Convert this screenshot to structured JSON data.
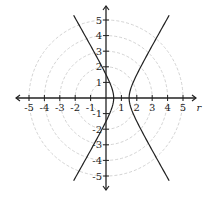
{
  "chart_data": {
    "type": "line",
    "subtype": "polar-graph",
    "title": "",
    "xlabel": "r",
    "ylabel": "",
    "xlim": [
      -5,
      5
    ],
    "ylim": [
      -5,
      5
    ],
    "x_ticks": [
      -5,
      -4,
      -3,
      -2,
      -1,
      1,
      2,
      3,
      4,
      5
    ],
    "y_ticks": [
      5,
      4,
      3,
      2,
      1,
      -1,
      -2,
      -3,
      -4,
      -5
    ],
    "grid": {
      "type": "concentric-circles",
      "radii": [
        1,
        2,
        3,
        4,
        5
      ],
      "style": "dashed",
      "color": "#c8c8c8"
    },
    "series": [
      {
        "name": "r = 1.5 / (1 + 2 cos θ)",
        "kind": "hyperbola",
        "center": [
          1,
          0
        ],
        "vertices": [
          [
            0.5,
            0
          ],
          [
            1.5,
            0
          ]
        ],
        "y_intercepts": [
          1.5,
          -1.5
        ],
        "a": 0.5,
        "b": 0.866,
        "y_range": [
          -5.3,
          5.3
        ],
        "color": "#222222"
      }
    ]
  },
  "axes": {
    "x_label": "r",
    "x_tick_labels": [
      "-5",
      "-4",
      "-3",
      "-2",
      "-1",
      "1",
      "2",
      "3",
      "4",
      "5"
    ],
    "y_tick_labels": [
      "5",
      "4",
      "3",
      "2",
      "1",
      "-1",
      "-2",
      "-3",
      "-4",
      "-5"
    ]
  }
}
